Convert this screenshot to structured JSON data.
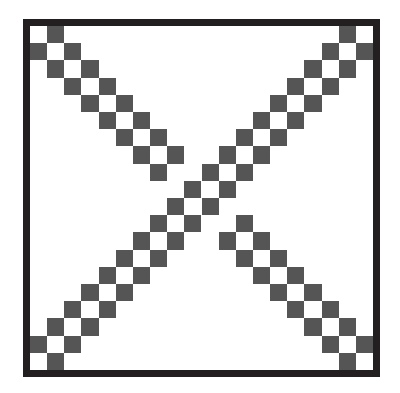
{
  "figure": {
    "grid_size": 20,
    "colors": {
      "background": "#ffffff",
      "frame": "#231f20",
      "cell": "#555555"
    },
    "strokes": [
      {
        "name": "anti-diagonal",
        "rule": "r + c in {18, 20}",
        "continuous": true
      },
      {
        "name": "main-diagonal-upper",
        "rule": "c - r in {-1, 1}",
        "rows": "0-8 (row 8 only c-r=-1)"
      },
      {
        "name": "main-diagonal-lower",
        "rule": "c - r in {-1, 1}",
        "rows": "11-19 (row 11 only c-r=1)"
      }
    ],
    "cells": [
      [
        0,
        1
      ],
      [
        1,
        0
      ],
      [
        1,
        2
      ],
      [
        2,
        1
      ],
      [
        2,
        3
      ],
      [
        3,
        2
      ],
      [
        3,
        4
      ],
      [
        4,
        3
      ],
      [
        4,
        5
      ],
      [
        5,
        4
      ],
      [
        5,
        6
      ],
      [
        6,
        5
      ],
      [
        6,
        7
      ],
      [
        7,
        6
      ],
      [
        7,
        8
      ],
      [
        8,
        7
      ],
      [
        11,
        12
      ],
      [
        12,
        11
      ],
      [
        12,
        13
      ],
      [
        13,
        12
      ],
      [
        13,
        14
      ],
      [
        14,
        13
      ],
      [
        14,
        15
      ],
      [
        15,
        14
      ],
      [
        15,
        16
      ],
      [
        16,
        15
      ],
      [
        16,
        17
      ],
      [
        17,
        16
      ],
      [
        17,
        18
      ],
      [
        18,
        17
      ],
      [
        18,
        19
      ],
      [
        19,
        18
      ],
      [
        0,
        18
      ],
      [
        1,
        17
      ],
      [
        1,
        19
      ],
      [
        2,
        16
      ],
      [
        2,
        18
      ],
      [
        3,
        15
      ],
      [
        3,
        17
      ],
      [
        4,
        14
      ],
      [
        4,
        16
      ],
      [
        5,
        13
      ],
      [
        5,
        15
      ],
      [
        6,
        12
      ],
      [
        6,
        14
      ],
      [
        7,
        11
      ],
      [
        7,
        13
      ],
      [
        8,
        10
      ],
      [
        8,
        12
      ],
      [
        9,
        9
      ],
      [
        9,
        11
      ],
      [
        10,
        8
      ],
      [
        10,
        10
      ],
      [
        11,
        7
      ],
      [
        11,
        9
      ],
      [
        12,
        6
      ],
      [
        12,
        8
      ],
      [
        13,
        5
      ],
      [
        13,
        7
      ],
      [
        14,
        4
      ],
      [
        14,
        6
      ],
      [
        15,
        3
      ],
      [
        15,
        5
      ],
      [
        16,
        2
      ],
      [
        16,
        4
      ],
      [
        17,
        1
      ],
      [
        17,
        3
      ],
      [
        18,
        0
      ],
      [
        18,
        2
      ],
      [
        19,
        1
      ]
    ]
  }
}
